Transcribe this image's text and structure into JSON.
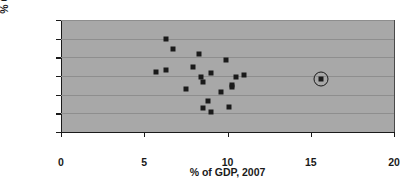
{
  "chart_data": {
    "type": "scatter",
    "title": "",
    "xlabel": "% of GDP, 2007",
    "ylabel": "% Change, 1990–2007",
    "xlim": [
      0,
      20
    ],
    "ylim": [
      0,
      0.6
    ],
    "grid": true,
    "legend": null,
    "plot_background": "#a8a8a8",
    "marker_color": "#1a1a1a",
    "xticks": [
      0,
      5,
      10,
      15,
      20
    ],
    "xtick_labels": [
      "0",
      "5",
      "10",
      "15",
      "20"
    ],
    "yticks": [
      0,
      0.1,
      0.2,
      0.3,
      0.4,
      0.5,
      0.6
    ],
    "ytick_labels": [
      "0%",
      "10%",
      "20%",
      "30%",
      "40%",
      "50%",
      "60%"
    ],
    "points": [
      {
        "x": 6.3,
        "y": 0.5,
        "highlighted": false
      },
      {
        "x": 6.7,
        "y": 0.445,
        "highlighted": false
      },
      {
        "x": 8.3,
        "y": 0.42,
        "highlighted": false
      },
      {
        "x": 9.9,
        "y": 0.385,
        "highlighted": false
      },
      {
        "x": 7.9,
        "y": 0.348,
        "highlighted": false
      },
      {
        "x": 6.3,
        "y": 0.332,
        "highlighted": false
      },
      {
        "x": 5.7,
        "y": 0.32,
        "highlighted": false
      },
      {
        "x": 9.0,
        "y": 0.318,
        "highlighted": false
      },
      {
        "x": 11.0,
        "y": 0.307,
        "highlighted": false
      },
      {
        "x": 10.5,
        "y": 0.295,
        "highlighted": false
      },
      {
        "x": 8.4,
        "y": 0.293,
        "highlighted": false
      },
      {
        "x": 15.6,
        "y": 0.285,
        "highlighted": true
      },
      {
        "x": 8.5,
        "y": 0.267,
        "highlighted": false
      },
      {
        "x": 10.3,
        "y": 0.252,
        "highlighted": false
      },
      {
        "x": 10.3,
        "y": 0.242,
        "highlighted": false
      },
      {
        "x": 7.5,
        "y": 0.228,
        "highlighted": false
      },
      {
        "x": 9.6,
        "y": 0.212,
        "highlighted": false
      },
      {
        "x": 8.8,
        "y": 0.168,
        "highlighted": false
      },
      {
        "x": 10.1,
        "y": 0.133,
        "highlighted": false
      },
      {
        "x": 8.5,
        "y": 0.13,
        "highlighted": false
      },
      {
        "x": 9.0,
        "y": 0.107,
        "highlighted": false
      }
    ]
  }
}
